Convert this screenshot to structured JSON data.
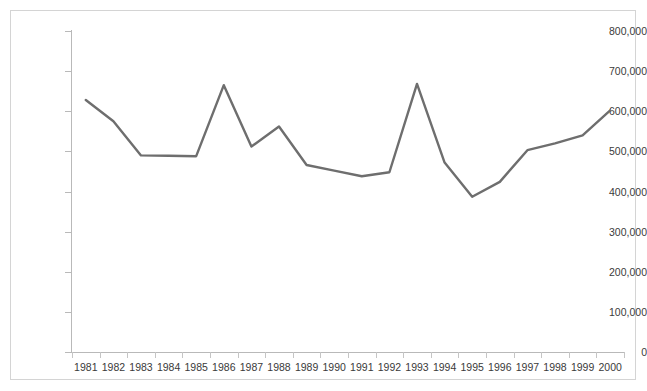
{
  "chart_data": {
    "type": "line",
    "title": "",
    "subtitle": "",
    "xlabel": "",
    "ylabel": "",
    "categories": [
      "1981",
      "1982",
      "1983",
      "1984",
      "1985",
      "1986",
      "1987",
      "1988",
      "1989",
      "1990",
      "1991",
      "1992",
      "1993",
      "1994",
      "1995",
      "1996",
      "1997",
      "1998",
      "1999",
      "2000"
    ],
    "series": [
      {
        "name": "Series 1",
        "color": "#6e6e6e",
        "values": [
          628000,
          575000,
          490000,
          489000,
          488000,
          665000,
          512000,
          562000,
          466000,
          452000,
          438000,
          448000,
          668000,
          472000,
          387000,
          424000,
          503000,
          520000,
          540000,
          602000
        ]
      }
    ],
    "ylim": [
      0,
      800000
    ],
    "yticks": [
      0,
      100000,
      200000,
      300000,
      400000,
      500000,
      600000,
      700000,
      800000
    ],
    "ytick_labels": [
      "0",
      "100,000",
      "200,000",
      "300,000",
      "400,000",
      "500,000",
      "600,000",
      "700,000",
      "800,000"
    ],
    "grid": false,
    "legend": false,
    "legend_position": "none",
    "axis_color": "#b9b9b9",
    "text_color": "#3a3a3a",
    "background_color": "#ffffff",
    "frame_color": "#d4d4d4"
  }
}
